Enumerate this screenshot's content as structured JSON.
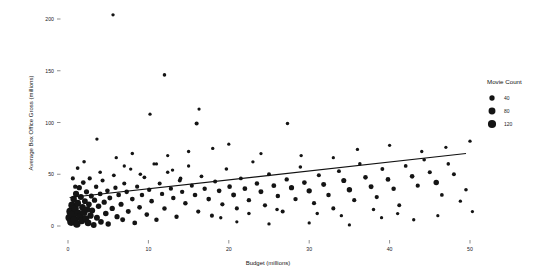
{
  "chart_data": {
    "type": "scatter",
    "title": "",
    "xlabel": "Budget (millions)",
    "ylabel": "Average Box Office Gross (millions)",
    "xlim": [
      -1.5,
      53
    ],
    "ylim": [
      -12,
      215
    ],
    "xticks": [
      0,
      10,
      20,
      30,
      40,
      50
    ],
    "xticklabels": [
      "0",
      "10",
      "20",
      "30",
      "40",
      "50"
    ],
    "yticks": [
      0,
      50,
      100,
      150,
      200
    ],
    "yticklabels": [
      "0",
      "50",
      "100",
      "150",
      "200"
    ],
    "grid": false,
    "size_legend": {
      "title": "Movie Count",
      "position": "right",
      "entries": [
        {
          "label": "40",
          "value": 40
        },
        {
          "label": "80",
          "value": 80
        },
        {
          "label": "120",
          "value": 120
        }
      ]
    },
    "trendline": {
      "type": "linear",
      "x_start": 0.2,
      "y_start": 27.5,
      "x_end": 49.5,
      "y_end": 70.0
    },
    "size_encoding": {
      "field": "Movie Count",
      "min_value": 5,
      "max_value": 130,
      "min_radius_px": 0.9,
      "max_radius_px": 4.2
    },
    "points": [
      {
        "x": 0.2,
        "y": 8,
        "s": 130
      },
      {
        "x": 0.3,
        "y": 14,
        "s": 120
      },
      {
        "x": 0.4,
        "y": 4,
        "s": 118
      },
      {
        "x": 0.5,
        "y": 20,
        "s": 95
      },
      {
        "x": 0.6,
        "y": 11,
        "s": 112
      },
      {
        "x": 0.7,
        "y": 26,
        "s": 70
      },
      {
        "x": 0.8,
        "y": 6,
        "s": 105
      },
      {
        "x": 0.9,
        "y": 17,
        "s": 88
      },
      {
        "x": 1.0,
        "y": 31,
        "s": 60
      },
      {
        "x": 1.1,
        "y": 2,
        "s": 96
      },
      {
        "x": 1.2,
        "y": 22,
        "s": 78
      },
      {
        "x": 1.3,
        "y": 12,
        "s": 102
      },
      {
        "x": 1.4,
        "y": 37,
        "s": 40
      },
      {
        "x": 1.5,
        "y": 9,
        "s": 90
      },
      {
        "x": 1.6,
        "y": 28,
        "s": 55
      },
      {
        "x": 1.7,
        "y": 5,
        "s": 85
      },
      {
        "x": 1.8,
        "y": 18,
        "s": 72
      },
      {
        "x": 1.9,
        "y": 42,
        "s": 30
      },
      {
        "x": 2.0,
        "y": 13,
        "s": 80
      },
      {
        "x": 2.1,
        "y": 24,
        "s": 50
      },
      {
        "x": 2.2,
        "y": 7,
        "s": 76
      },
      {
        "x": 2.3,
        "y": 33,
        "s": 38
      },
      {
        "x": 2.4,
        "y": 16,
        "s": 64
      },
      {
        "x": 2.5,
        "y": 3,
        "s": 70
      },
      {
        "x": 2.6,
        "y": 21,
        "s": 48
      },
      {
        "x": 2.7,
        "y": 46,
        "s": 22
      },
      {
        "x": 2.8,
        "y": 10,
        "s": 62
      },
      {
        "x": 2.9,
        "y": 29,
        "s": 36
      },
      {
        "x": 3.0,
        "y": 15,
        "s": 58
      },
      {
        "x": 3.2,
        "y": 1,
        "s": 52
      },
      {
        "x": 3.3,
        "y": 25,
        "s": 40
      },
      {
        "x": 3.5,
        "y": 38,
        "s": 26
      },
      {
        "x": 3.6,
        "y": 8,
        "s": 54
      },
      {
        "x": 3.8,
        "y": 19,
        "s": 44
      },
      {
        "x": 4.0,
        "y": 31,
        "s": 32
      },
      {
        "x": 4.1,
        "y": 4,
        "s": 48
      },
      {
        "x": 4.3,
        "y": 44,
        "s": 20
      },
      {
        "x": 4.5,
        "y": 23,
        "s": 38
      },
      {
        "x": 4.7,
        "y": 12,
        "s": 46
      },
      {
        "x": 4.9,
        "y": 34,
        "s": 28
      },
      {
        "x": 5.0,
        "y": 2,
        "s": 42
      },
      {
        "x": 5.2,
        "y": 27,
        "s": 34
      },
      {
        "x": 5.5,
        "y": 17,
        "s": 40
      },
      {
        "x": 5.7,
        "y": 49,
        "s": 16
      },
      {
        "x": 5.9,
        "y": 37,
        "s": 24
      },
      {
        "x": 6.1,
        "y": 9,
        "s": 38
      },
      {
        "x": 6.3,
        "y": 30,
        "s": 30
      },
      {
        "x": 6.6,
        "y": 21,
        "s": 36
      },
      {
        "x": 6.8,
        "y": 6,
        "s": 34
      },
      {
        "x": 7.0,
        "y": 41,
        "s": 20
      },
      {
        "x": 7.3,
        "y": 33,
        "s": 28
      },
      {
        "x": 7.5,
        "y": 14,
        "s": 34
      },
      {
        "x": 7.8,
        "y": 55,
        "s": 12
      },
      {
        "x": 8.0,
        "y": 26,
        "s": 30
      },
      {
        "x": 8.3,
        "y": 3,
        "s": 32
      },
      {
        "x": 8.6,
        "y": 38,
        "s": 22
      },
      {
        "x": 8.9,
        "y": 18,
        "s": 30
      },
      {
        "x": 9.2,
        "y": 30,
        "s": 26
      },
      {
        "x": 9.5,
        "y": 47,
        "s": 16
      },
      {
        "x": 9.8,
        "y": 11,
        "s": 28
      },
      {
        "x": 10.1,
        "y": 35,
        "s": 24
      },
      {
        "x": 10.4,
        "y": 24,
        "s": 28
      },
      {
        "x": 10.7,
        "y": 60,
        "s": 11
      },
      {
        "x": 11.0,
        "y": 6,
        "s": 26
      },
      {
        "x": 11.4,
        "y": 41,
        "s": 20
      },
      {
        "x": 11.7,
        "y": 31,
        "s": 24
      },
      {
        "x": 12.0,
        "y": 17,
        "s": 26
      },
      {
        "x": 12.4,
        "y": 52,
        "s": 13
      },
      {
        "x": 12.8,
        "y": 36,
        "s": 22
      },
      {
        "x": 13.1,
        "y": 27,
        "s": 26
      },
      {
        "x": 13.5,
        "y": 9,
        "s": 24
      },
      {
        "x": 13.9,
        "y": 44,
        "s": 18
      },
      {
        "x": 14.2,
        "y": 33,
        "s": 24
      },
      {
        "x": 14.6,
        "y": 22,
        "s": 26
      },
      {
        "x": 15.0,
        "y": 58,
        "s": 12
      },
      {
        "x": 15.4,
        "y": 39,
        "s": 20
      },
      {
        "x": 15.8,
        "y": 30,
        "s": 28
      },
      {
        "x": 16.2,
        "y": 14,
        "s": 22
      },
      {
        "x": 16.6,
        "y": 48,
        "s": 16
      },
      {
        "x": 17.0,
        "y": 36,
        "s": 24
      },
      {
        "x": 17.5,
        "y": 26,
        "s": 28
      },
      {
        "x": 17.9,
        "y": 10,
        "s": 20
      },
      {
        "x": 18.3,
        "y": 43,
        "s": 20
      },
      {
        "x": 18.8,
        "y": 34,
        "s": 30
      },
      {
        "x": 19.2,
        "y": 21,
        "s": 22
      },
      {
        "x": 19.7,
        "y": 55,
        "s": 14
      },
      {
        "x": 20.1,
        "y": 38,
        "s": 28
      },
      {
        "x": 20.6,
        "y": 30,
        "s": 34
      },
      {
        "x": 21.0,
        "y": 17,
        "s": 20
      },
      {
        "x": 21.5,
        "y": 46,
        "s": 18
      },
      {
        "x": 22.0,
        "y": 36,
        "s": 30
      },
      {
        "x": 22.5,
        "y": 25,
        "s": 24
      },
      {
        "x": 23.0,
        "y": 62,
        "s": 12
      },
      {
        "x": 23.5,
        "y": 41,
        "s": 26
      },
      {
        "x": 24.0,
        "y": 33,
        "s": 34
      },
      {
        "x": 24.5,
        "y": 20,
        "s": 22
      },
      {
        "x": 25.0,
        "y": 50,
        "s": 18
      },
      {
        "x": 25.6,
        "y": 39,
        "s": 32
      },
      {
        "x": 26.1,
        "y": 29,
        "s": 26
      },
      {
        "x": 26.7,
        "y": 14,
        "s": 20
      },
      {
        "x": 27.2,
        "y": 45,
        "s": 24
      },
      {
        "x": 27.8,
        "y": 37,
        "s": 38
      },
      {
        "x": 28.3,
        "y": 26,
        "s": 24
      },
      {
        "x": 28.9,
        "y": 57,
        "s": 14
      },
      {
        "x": 29.4,
        "y": 42,
        "s": 30
      },
      {
        "x": 30.0,
        "y": 34,
        "s": 40
      },
      {
        "x": 30.6,
        "y": 22,
        "s": 22
      },
      {
        "x": 31.2,
        "y": 49,
        "s": 20
      },
      {
        "x": 31.8,
        "y": 40,
        "s": 34
      },
      {
        "x": 32.4,
        "y": 30,
        "s": 26
      },
      {
        "x": 33.0,
        "y": 17,
        "s": 20
      },
      {
        "x": 33.7,
        "y": 53,
        "s": 18
      },
      {
        "x": 34.3,
        "y": 44,
        "s": 36
      },
      {
        "x": 35.0,
        "y": 35,
        "s": 42
      },
      {
        "x": 35.6,
        "y": 25,
        "s": 22
      },
      {
        "x": 36.3,
        "y": 60,
        "s": 14
      },
      {
        "x": 37.0,
        "y": 47,
        "s": 28
      },
      {
        "x": 37.7,
        "y": 38,
        "s": 34
      },
      {
        "x": 38.4,
        "y": 28,
        "s": 22
      },
      {
        "x": 39.1,
        "y": 55,
        "s": 18
      },
      {
        "x": 39.8,
        "y": 45,
        "s": 30
      },
      {
        "x": 40.5,
        "y": 36,
        "s": 26
      },
      {
        "x": 41.2,
        "y": 20,
        "s": 18
      },
      {
        "x": 42.0,
        "y": 58,
        "s": 16
      },
      {
        "x": 42.8,
        "y": 48,
        "s": 28
      },
      {
        "x": 43.5,
        "y": 39,
        "s": 22
      },
      {
        "x": 44.3,
        "y": 64,
        "s": 14
      },
      {
        "x": 45.0,
        "y": 52,
        "s": 20
      },
      {
        "x": 45.8,
        "y": 42,
        "s": 44
      },
      {
        "x": 46.5,
        "y": 30,
        "s": 16
      },
      {
        "x": 47.3,
        "y": 60,
        "s": 14
      },
      {
        "x": 48.0,
        "y": 50,
        "s": 18
      },
      {
        "x": 48.8,
        "y": 24,
        "s": 12
      },
      {
        "x": 49.5,
        "y": 35,
        "s": 14
      },
      {
        "x": 50.3,
        "y": 14,
        "s": 11
      },
      {
        "x": 5.6,
        "y": 204,
        "s": 12
      },
      {
        "x": 12.0,
        "y": 146,
        "s": 14
      },
      {
        "x": 10.2,
        "y": 108,
        "s": 11
      },
      {
        "x": 16.3,
        "y": 113,
        "s": 11
      },
      {
        "x": 16.0,
        "y": 99,
        "s": 20
      },
      {
        "x": 27.3,
        "y": 99,
        "s": 13
      },
      {
        "x": 3.6,
        "y": 84,
        "s": 12
      },
      {
        "x": 20.0,
        "y": 79,
        "s": 11
      },
      {
        "x": 18.0,
        "y": 75,
        "s": 12
      },
      {
        "x": 15.0,
        "y": 72,
        "s": 12
      },
      {
        "x": 12.4,
        "y": 68,
        "s": 11
      },
      {
        "x": 8.0,
        "y": 70,
        "s": 13
      },
      {
        "x": 6.0,
        "y": 66,
        "s": 12
      },
      {
        "x": 2.0,
        "y": 62,
        "s": 14
      },
      {
        "x": 1.2,
        "y": 56,
        "s": 16
      },
      {
        "x": 24.0,
        "y": 70,
        "s": 11
      },
      {
        "x": 29.0,
        "y": 68,
        "s": 12
      },
      {
        "x": 33.0,
        "y": 66,
        "s": 11
      },
      {
        "x": 36.0,
        "y": 74,
        "s": 12
      },
      {
        "x": 40.0,
        "y": 78,
        "s": 11
      },
      {
        "x": 44.0,
        "y": 72,
        "s": 12
      },
      {
        "x": 47.0,
        "y": 76,
        "s": 11
      },
      {
        "x": 50.0,
        "y": 82,
        "s": 12
      },
      {
        "x": 21.0,
        "y": 4,
        "s": 11
      },
      {
        "x": 25.0,
        "y": 2,
        "s": 12
      },
      {
        "x": 30.0,
        "y": 3,
        "s": 11
      },
      {
        "x": 35.0,
        "y": 1,
        "s": 11
      },
      {
        "x": 39.0,
        "y": 8,
        "s": 11
      },
      {
        "x": 43.0,
        "y": 6,
        "s": 12
      },
      {
        "x": 46.0,
        "y": 10,
        "s": 11
      },
      {
        "x": 31.0,
        "y": 12,
        "s": 13
      },
      {
        "x": 19.0,
        "y": 8,
        "s": 12
      },
      {
        "x": 22.5,
        "y": 12,
        "s": 14
      },
      {
        "x": 26.0,
        "y": 16,
        "s": 14
      },
      {
        "x": 34.0,
        "y": 10,
        "s": 12
      },
      {
        "x": 38.0,
        "y": 16,
        "s": 13
      },
      {
        "x": 41.0,
        "y": 12,
        "s": 12
      },
      {
        "x": 4.0,
        "y": 52,
        "s": 14
      },
      {
        "x": 9.0,
        "y": 50,
        "s": 14
      },
      {
        "x": 13.0,
        "y": 54,
        "s": 13
      },
      {
        "x": 7.0,
        "y": 58,
        "s": 12
      },
      {
        "x": 11.0,
        "y": 60,
        "s": 12
      },
      {
        "x": 14.0,
        "y": 46,
        "s": 16
      },
      {
        "x": 0.6,
        "y": 46,
        "s": 20
      },
      {
        "x": 0.9,
        "y": 38,
        "s": 24
      }
    ]
  }
}
